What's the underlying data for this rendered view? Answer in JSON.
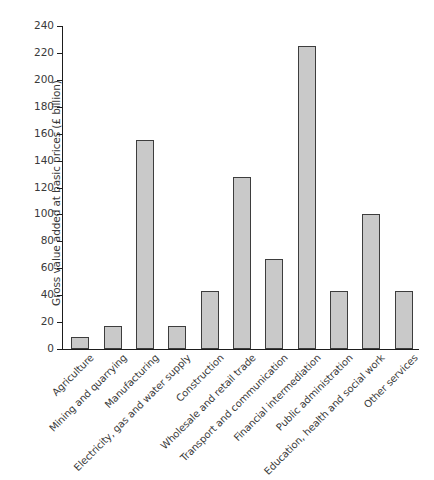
{
  "chart_data": {
    "type": "bar",
    "title": "",
    "xlabel": "",
    "ylabel": "Gross value added at basic prices (£ billion)",
    "ylim": [
      0,
      240
    ],
    "yticks": [
      0,
      20,
      40,
      60,
      80,
      100,
      120,
      140,
      160,
      180,
      200,
      220,
      240
    ],
    "grid": false,
    "legend": null,
    "bar_color": "#c9c9c9",
    "bar_edge_color": "#3d3d3d",
    "axis_color": "#1d1d1d",
    "categories": [
      "Agriculture",
      "Mining and quarrying",
      "Manufacturing",
      "Electricity, gas and water supply",
      "Construction",
      "Wholesale and retail trade",
      "Transport and communication",
      "Financial intermediation",
      "Public administration",
      "Education, health and social work",
      "Other services"
    ],
    "values": [
      9,
      17,
      155,
      17,
      43,
      128,
      67,
      225,
      43,
      100,
      43
    ]
  }
}
